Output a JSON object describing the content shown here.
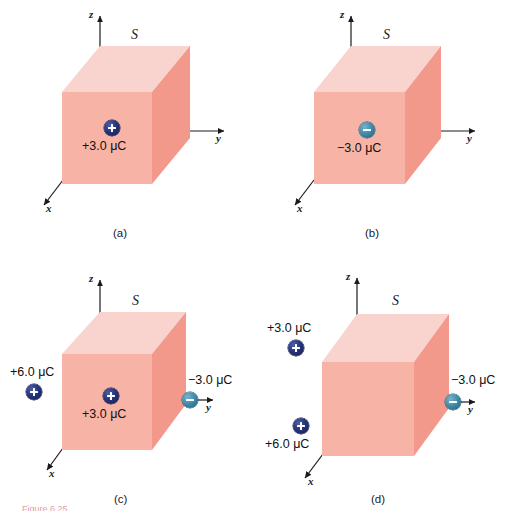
{
  "figure": {
    "caption_partial": "Figure 6.25",
    "surface_label": "S",
    "axes": {
      "x": "x",
      "y": "y",
      "z": "z"
    },
    "colors": {
      "box_front": "#f7b3a5",
      "box_top": "#f9d3cd",
      "box_right": "#f2998c",
      "charge_positive": "#27347a",
      "charge_negative": "#3f8aa8",
      "caption": "#c24b63"
    }
  },
  "panels": [
    {
      "id": "a",
      "caption": "(a)",
      "surface_label": "S",
      "axes": {
        "x": "x",
        "y": "y",
        "z": "z"
      },
      "charges": [
        {
          "name": "charge-inside",
          "label": "+3.0 μC",
          "sign": "positive",
          "position": "inside-front-face",
          "label_position": "below"
        }
      ]
    },
    {
      "id": "b",
      "caption": "(b)",
      "surface_label": "S",
      "axes": {
        "x": "x",
        "y": "y",
        "z": "z"
      },
      "charges": [
        {
          "name": "charge-inside",
          "label": "−3.0 μC",
          "sign": "negative",
          "position": "inside-front-face",
          "label_position": "below"
        }
      ]
    },
    {
      "id": "c",
      "caption": "(c)",
      "surface_label": "S",
      "axes": {
        "x": "x",
        "y": "y",
        "z": "z"
      },
      "charges": [
        {
          "name": "charge-outside-left",
          "label": "+6.0 μC",
          "sign": "positive",
          "position": "outside-left",
          "label_position": "above"
        },
        {
          "name": "charge-inside",
          "label": "+3.0 μC",
          "sign": "positive",
          "position": "inside-front-face",
          "label_position": "below"
        },
        {
          "name": "charge-on-surface-right",
          "label": "−3.0 μC",
          "sign": "negative",
          "position": "on-y-axis-right",
          "label_position": "above"
        }
      ]
    },
    {
      "id": "d",
      "caption": "(d)",
      "surface_label": "S",
      "axes": {
        "x": "x",
        "y": "y",
        "z": "z"
      },
      "charges": [
        {
          "name": "charge-outside-upper-left",
          "label": "+3.0 μC",
          "sign": "positive",
          "position": "outside-upper-left",
          "label_position": "above"
        },
        {
          "name": "charge-outside-lower-left",
          "label": "+6.0 μC",
          "sign": "positive",
          "position": "outside-lower-left",
          "label_position": "below"
        },
        {
          "name": "charge-on-surface-right",
          "label": "−3.0 μC",
          "sign": "negative",
          "position": "on-y-axis-right",
          "label_position": "above"
        }
      ]
    }
  ]
}
